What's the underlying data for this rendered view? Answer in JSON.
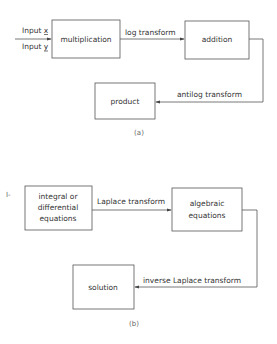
{
  "diagram_a": {
    "inputs": [
      "Input x",
      "Input y"
    ],
    "input_vars": [
      "x",
      "y"
    ],
    "boxes": {
      "multiplication": "multiplication",
      "addition": "addition",
      "product": "product"
    },
    "edges": {
      "log": "log transform",
      "antilog": "antilog transform"
    },
    "caption": "(a)"
  },
  "diagram_b": {
    "marker": "I-",
    "boxes": {
      "equations_line1": "integral or",
      "equations_line2": "differential",
      "equations_line3": "equations",
      "algebraic_line1": "algebraic",
      "algebraic_line2": "equations",
      "solution": "solution"
    },
    "edges": {
      "laplace": "Laplace transform",
      "inverse": "inverse Laplace transform"
    },
    "caption": "(b)"
  }
}
